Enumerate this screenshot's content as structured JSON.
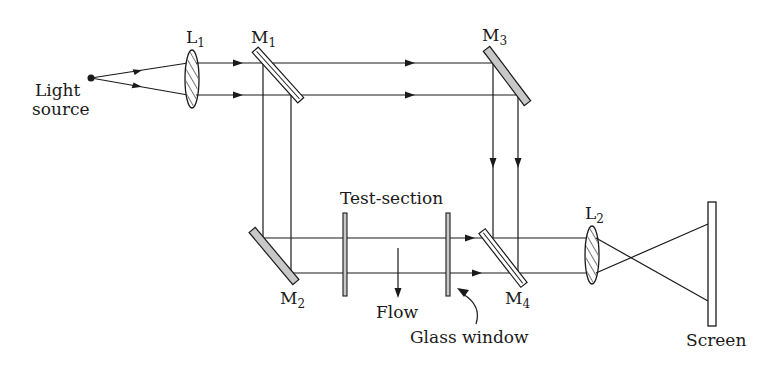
{
  "diagram": {
    "type": "Mach-Zehnder interferometer schematic",
    "labels": {
      "light_source_line1": "Light",
      "light_source_line2": "source",
      "lens1": "L",
      "lens1_sub": "1",
      "mirror1": "M",
      "mirror1_sub": "1",
      "mirror2": "M",
      "mirror2_sub": "2",
      "mirror3": "M",
      "mirror3_sub": "3",
      "mirror4": "M",
      "mirror4_sub": "4",
      "lens2": "L",
      "lens2_sub": "2",
      "test_section": "Test-section",
      "flow": "Flow",
      "glass_window": "Glass window",
      "screen": "Screen"
    },
    "colors": {
      "line": "#1a1a1a",
      "mirror_fill": "#c8c8c8",
      "background": "#ffffff"
    }
  }
}
